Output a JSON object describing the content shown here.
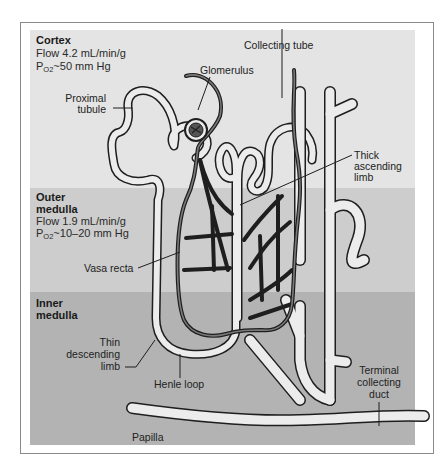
{
  "diagram": {
    "zones": [
      {
        "id": "cortex",
        "title_lines": [
          "Cortex"
        ],
        "flow": "Flow 4.2 mL/min/g",
        "po2_prefix": "P",
        "po2_sub": "O2",
        "po2_value": "~50 mm Hg",
        "color": "#e4e4e4"
      },
      {
        "id": "outer-medulla",
        "title_lines": [
          "Outer",
          "medulla"
        ],
        "flow": "Flow 1.9 mL/min/g",
        "po2_prefix": "P",
        "po2_sub": "O2",
        "po2_value": "~10–20 mm Hg",
        "color": "#cdcdcd"
      },
      {
        "id": "inner-medulla",
        "title_lines": [
          "Inner",
          "medulla"
        ],
        "color": "#b3b3b3"
      }
    ],
    "labels": {
      "collecting_tube": "Collecting tube",
      "glomerulus": "Glomerulus",
      "proximal_tubule": [
        "Proximal",
        "tubule"
      ],
      "thick_ascending_limb": [
        "Thick",
        "ascending",
        "limb"
      ],
      "vasa_recta": "Vasa recta",
      "thin_descending_limb": [
        "Thin",
        "descending",
        "limb"
      ],
      "henle_loop": "Henle loop",
      "terminal_collecting_duct": [
        "Terminal",
        "collecting",
        "duct"
      ],
      "papilla": "Papilla"
    },
    "colors": {
      "tubule_fill": "#ececec",
      "outline": "#1e1e1e",
      "vessel": "#555555",
      "frame": "#8a8a8a"
    }
  }
}
